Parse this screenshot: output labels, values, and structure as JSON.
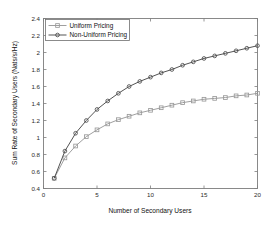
{
  "chart_data": {
    "type": "line",
    "title": "",
    "xlabel": "Number of Secondary Users",
    "ylabel": "Sum Rate of Secondary Users (Nats/s/Hz)",
    "xlim": [
      0,
      20
    ],
    "ylim": [
      0.4,
      2.4
    ],
    "xticks": [
      0,
      5,
      10,
      15,
      20
    ],
    "xtick_labels": [
      "0",
      "5",
      "10",
      "15",
      "20"
    ],
    "yticks": [
      0.4,
      0.6,
      0.8,
      1.0,
      1.2,
      1.4,
      1.6,
      1.8,
      2.0,
      2.2,
      2.4
    ],
    "ytick_labels": [
      "0.4",
      "0.6",
      "0.8",
      "1",
      "1.2",
      "1.4",
      "1.6",
      "1.8",
      "2",
      "2.2",
      "2.4"
    ],
    "grid": false,
    "legend_position": "upper left",
    "x": [
      1,
      2,
      3,
      4,
      5,
      6,
      7,
      8,
      9,
      10,
      11,
      12,
      13,
      14,
      15,
      16,
      17,
      18,
      19,
      20
    ],
    "series": [
      {
        "name": "Uniform Pricing",
        "marker": "square",
        "color": "#9a9a9a",
        "values": [
          0.52,
          0.76,
          0.9,
          1.01,
          1.09,
          1.16,
          1.21,
          1.25,
          1.29,
          1.32,
          1.35,
          1.38,
          1.41,
          1.43,
          1.45,
          1.46,
          1.47,
          1.49,
          1.5,
          1.52
        ]
      },
      {
        "name": "Non-Uniform Pricing",
        "marker": "circle",
        "color": "#4a4a4a",
        "values": [
          0.52,
          0.84,
          1.05,
          1.2,
          1.33,
          1.43,
          1.52,
          1.6,
          1.66,
          1.71,
          1.76,
          1.8,
          1.85,
          1.89,
          1.93,
          1.96,
          1.99,
          2.02,
          2.05,
          2.08
        ]
      }
    ]
  },
  "legend": {
    "entries": [
      {
        "label": "Uniform Pricing"
      },
      {
        "label": "Non-Uniform Pricing"
      }
    ]
  }
}
